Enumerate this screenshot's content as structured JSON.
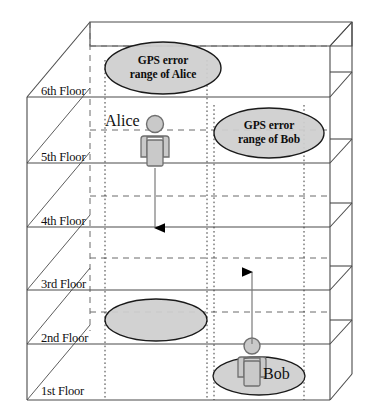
{
  "diagram": {
    "colors": {
      "ellipse_fill": "#cfcfcf",
      "ellipse_stroke": "#1a1a1a",
      "person_fill": "#c9c9c9",
      "person_stroke": "#6f6f6f",
      "solid_line": "#4a4a4a",
      "dashed_line": "#6b6b6b",
      "dotted_line": "#3a3a3a",
      "arrow": "#000000",
      "text": "#111111"
    },
    "floors": [
      {
        "id": "floor-6",
        "label": "6th Floor"
      },
      {
        "id": "floor-5",
        "label": "5th Floor"
      },
      {
        "id": "floor-4",
        "label": "4th Floor"
      },
      {
        "id": "floor-3",
        "label": "3rd Floor"
      },
      {
        "id": "floor-2",
        "label": "2nd Floor"
      },
      {
        "id": "floor-1",
        "label": "1st Floor"
      }
    ],
    "callouts": [
      {
        "id": "gps-error-alice",
        "line1": "GPS error",
        "line2": "range of Alice"
      },
      {
        "id": "gps-error-bob",
        "line1": "GPS error",
        "line2": "range of Bob"
      }
    ],
    "people": [
      {
        "id": "alice",
        "label": "Alice",
        "floor": "5th Floor",
        "direction": "down"
      },
      {
        "id": "bob",
        "label": "Bob",
        "floor": "1st Floor",
        "direction": "up"
      }
    ],
    "error_ellipses": [
      {
        "id": "alice-error-ellipse-floor2",
        "label": ""
      },
      {
        "id": "bob-error-ellipse-floor1",
        "label": ""
      }
    ]
  }
}
